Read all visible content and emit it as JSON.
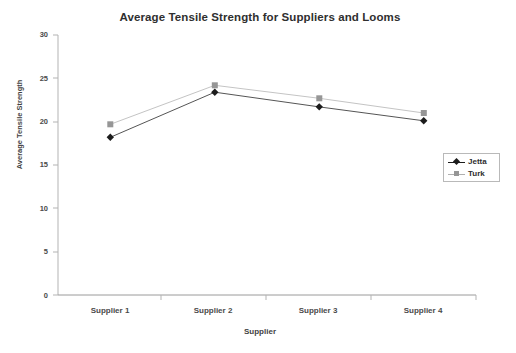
{
  "chart_data": {
    "type": "line",
    "title": "Average Tensile Strength for Suppliers and Looms",
    "xlabel": "Supplier",
    "ylabel": "Average Tensile Strength",
    "categories": [
      "Supplier 1",
      "Supplier 2",
      "Supplier 3",
      "Supplier 4"
    ],
    "series": [
      {
        "name": "Jetta",
        "values": [
          18.2,
          23.4,
          21.7,
          20.1
        ],
        "color": "#1c1c1c",
        "marker": "diamond"
      },
      {
        "name": "Turk",
        "values": [
          19.7,
          24.2,
          22.7,
          21.0
        ],
        "color": "#969696",
        "marker": "square"
      }
    ],
    "ylim": [
      0,
      30
    ],
    "yticks": [
      0,
      5,
      10,
      15,
      20,
      25,
      30
    ],
    "ytick_labels": [
      "0",
      "5",
      "10",
      "15",
      "20",
      "25",
      "30"
    ],
    "grid": false,
    "legend_position": "right-center"
  },
  "axes": {
    "y_tick_0": "0",
    "y_tick_1": "5",
    "y_tick_2": "10",
    "y_tick_3": "15",
    "y_tick_4": "20",
    "y_tick_5": "25",
    "y_tick_6": "30",
    "x_tick_0": "Supplier 1",
    "x_tick_1": "Supplier 2",
    "x_tick_2": "Supplier 3",
    "x_tick_3": "Supplier 4"
  },
  "legend": {
    "entry_0": "Jetta",
    "entry_1": "Turk"
  }
}
